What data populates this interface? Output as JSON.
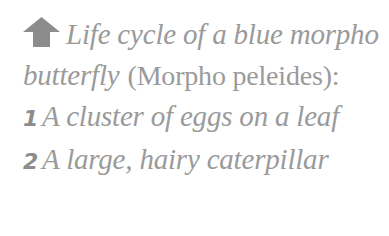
{
  "caption": {
    "icon": "up-arrow-icon",
    "title": "Life cycle of a blue morpho butterfly",
    "scientific_name": "(Morpho peleides):",
    "items": [
      {
        "number": "1",
        "text": "A cluster of eggs on a leaf"
      },
      {
        "number": "2",
        "text": "A large, hairy caterpillar"
      }
    ],
    "colors": {
      "text": "#9a9a9a",
      "icon": "#8c8c8c"
    }
  }
}
